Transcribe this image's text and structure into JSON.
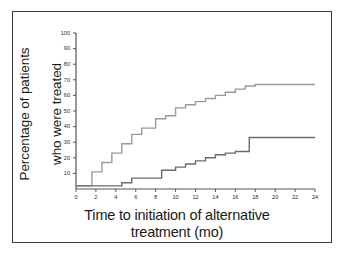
{
  "figure": {
    "border_color": "#3a3a3a",
    "background": "#ffffff"
  },
  "axes": {
    "y_label_line1": "Percentage of patients",
    "y_label_line2": "who were treated",
    "x_label_line1": "Time to initiation of alternative",
    "x_label_line2": "treatment (mo)"
  },
  "chart_data": {
    "type": "line",
    "title": "",
    "xlabel": "Time to initiation of alternative treatment (mo)",
    "ylabel": "Percentage of patients who were treated",
    "xlim": [
      0,
      24
    ],
    "ylim": [
      0,
      100
    ],
    "xticks": [
      0,
      2,
      4,
      6,
      8,
      10,
      12,
      14,
      16,
      18,
      20,
      22,
      24
    ],
    "xtick_labels": [
      "0",
      "2",
      "4",
      "6",
      "8",
      "10",
      "12",
      "14",
      "16",
      "18",
      "20",
      "22",
      "24"
    ],
    "yticks": [
      10,
      20,
      30,
      40,
      50,
      60,
      70,
      80,
      90,
      100
    ],
    "ytick_labels": [
      "10",
      "20",
      "30",
      "40",
      "50",
      "60",
      "70",
      "80",
      "90",
      "100"
    ],
    "grid": false,
    "legend": "none",
    "step_style": "post",
    "series": [
      {
        "name": "upper-curve",
        "color": "#9a9a9a",
        "line_width": 1.4,
        "x": [
          0,
          1,
          1.6,
          2,
          2.6,
          3,
          3.6,
          4,
          4.6,
          5,
          5.6,
          6,
          6.6,
          7,
          8,
          9,
          10,
          11,
          12,
          13,
          14,
          15,
          16,
          17,
          18,
          24
        ],
        "y": [
          2,
          2,
          11,
          11,
          17,
          17,
          23,
          23,
          29,
          29,
          35,
          35,
          39,
          39,
          45,
          47,
          52,
          54,
          56,
          58,
          60,
          62,
          64,
          66,
          67,
          67
        ]
      },
      {
        "name": "lower-curve",
        "color": "#6b6b6b",
        "line_width": 1.4,
        "x": [
          0,
          4,
          4.6,
          5,
          5.6,
          6,
          8,
          8.6,
          9,
          10,
          11,
          12,
          13,
          14,
          15,
          16,
          17,
          17.4,
          24
        ],
        "y": [
          2,
          2,
          4,
          4,
          7,
          7,
          7,
          12,
          12,
          14,
          16,
          18,
          20,
          22,
          23,
          24,
          24,
          33,
          33
        ]
      }
    ]
  }
}
